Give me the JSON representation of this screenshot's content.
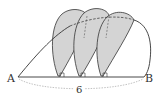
{
  "diagram": {
    "points": {
      "A": "A",
      "B": "B"
    },
    "length_label": "6",
    "colors": {
      "line": "#333333",
      "fill": "#d4d4d4",
      "dash": "#555555",
      "dim": "#888888"
    },
    "leaves": [
      {
        "foot_x": 58
      },
      {
        "foot_x": 79
      },
      {
        "foot_x": 101
      }
    ]
  }
}
